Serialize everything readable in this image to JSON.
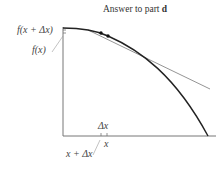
{
  "title": {
    "text": "Answer to part ",
    "part": "d"
  },
  "labels": {
    "f_x_plus_dx": "f(x + Δx)",
    "f_x": "f(x)",
    "delta_x": "Δx",
    "x": "x",
    "x_plus_dx": "x + Δx"
  },
  "colors": {
    "axis": "#777777",
    "curve": "#222222",
    "tangent": "#888888",
    "text": "#444444"
  }
}
